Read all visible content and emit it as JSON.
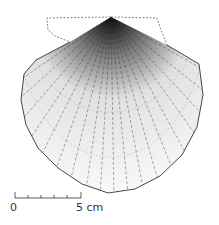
{
  "figure": {
    "colors": {
      "ink": "#1a1a1a",
      "outline": "#333333",
      "dashed": "#666666",
      "background": "#ffffff"
    }
  },
  "scale_bar": {
    "start_label": "0",
    "end_label": "5 cm",
    "ticks": 5
  }
}
